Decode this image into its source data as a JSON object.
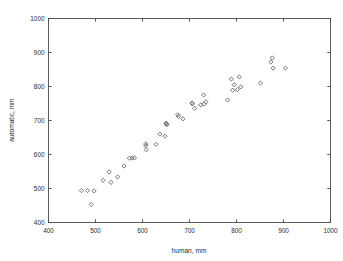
{
  "chart_data": {
    "type": "scatter",
    "title": "",
    "xlabel": "human, mm",
    "ylabel": "automatic, mm",
    "xlim": [
      400,
      1000
    ],
    "ylim": [
      400,
      1000
    ],
    "xticks": [
      400,
      500,
      600,
      700,
      800,
      900,
      1000
    ],
    "yticks": [
      400,
      500,
      600,
      700,
      800,
      900,
      1000
    ],
    "xticklabels": [
      "400",
      "500",
      "600",
      "700",
      "800",
      "900",
      "1000"
    ],
    "yticklabels": [
      "400",
      "500",
      "600",
      "700",
      "800",
      "900",
      "1000"
    ],
    "grid": false,
    "legend": null,
    "marker": "diamond",
    "marker_color": "#555555",
    "series": [
      {
        "name": "measurements",
        "points": [
          [
            470,
            494
          ],
          [
            483,
            494
          ],
          [
            491,
            453
          ],
          [
            497,
            493
          ],
          [
            516,
            524
          ],
          [
            529,
            549
          ],
          [
            533,
            518
          ],
          [
            547,
            534
          ],
          [
            561,
            566
          ],
          [
            572,
            589
          ],
          [
            578,
            590
          ],
          [
            583,
            590
          ],
          [
            607,
            631
          ],
          [
            607,
            626
          ],
          [
            608,
            614
          ],
          [
            629,
            630
          ],
          [
            637,
            660
          ],
          [
            648,
            654
          ],
          [
            650,
            692
          ],
          [
            651,
            690
          ],
          [
            652,
            688
          ],
          [
            675,
            717
          ],
          [
            677,
            712
          ],
          [
            686,
            705
          ],
          [
            705,
            752
          ],
          [
            706,
            749
          ],
          [
            711,
            736
          ],
          [
            724,
            746
          ],
          [
            730,
            775
          ],
          [
            731,
            748
          ],
          [
            735,
            755
          ],
          [
            781,
            760
          ],
          [
            789,
            822
          ],
          [
            792,
            789
          ],
          [
            795,
            805
          ],
          [
            802,
            791
          ],
          [
            806,
            828
          ],
          [
            809,
            799
          ],
          [
            851,
            810
          ],
          [
            873,
            872
          ],
          [
            876,
            884
          ],
          [
            878,
            854
          ],
          [
            904,
            854
          ]
        ]
      }
    ]
  },
  "axes": {
    "x_title": "human, mm",
    "y_title": "automatic, mm"
  }
}
